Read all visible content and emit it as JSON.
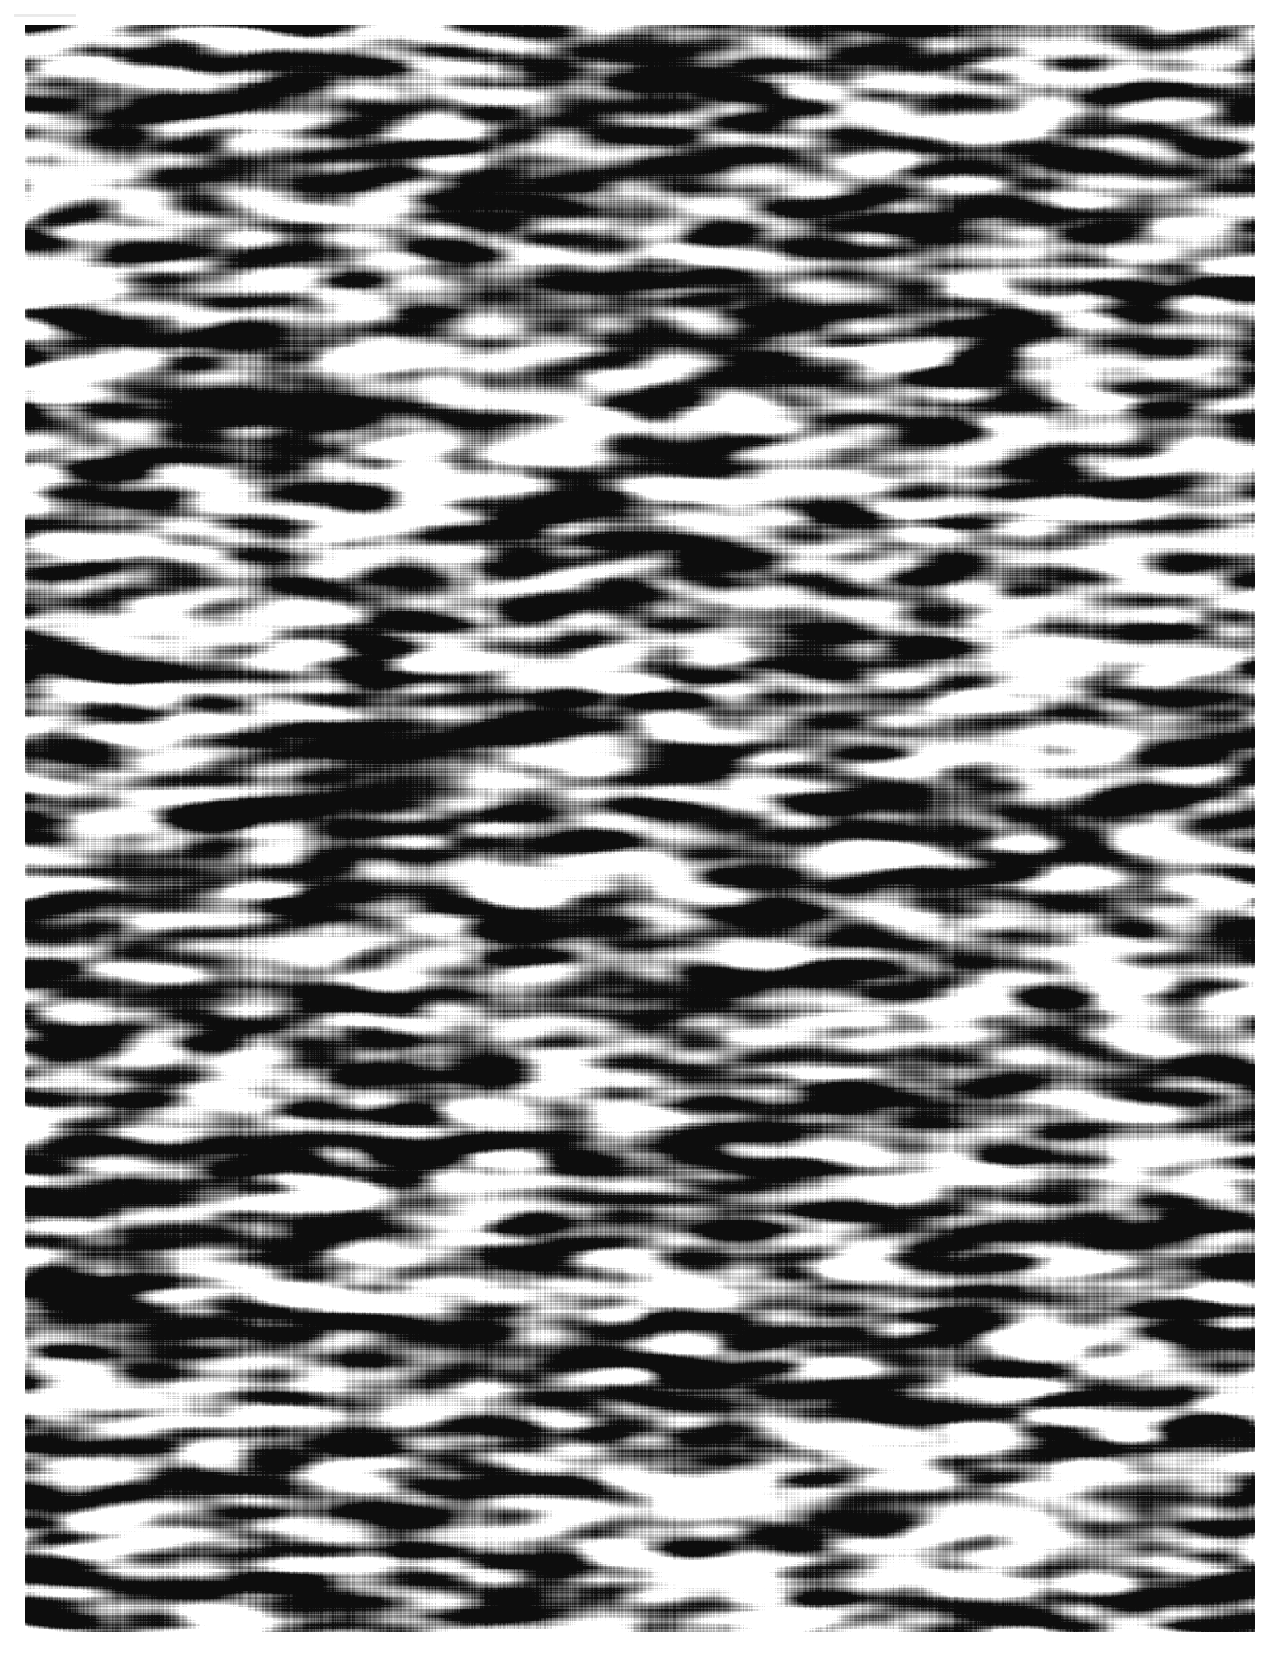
{
  "page": {
    "width": 1280,
    "height": 1676,
    "background_color": "#ffffff",
    "document_type": "scanned-page",
    "visible_text": ""
  },
  "margins": {
    "top": 25,
    "left": 25,
    "right": 25,
    "bottom": 44
  },
  "texture": {
    "name": "anisotropic-binary-noise",
    "x": 25,
    "y": 25,
    "width": 1230,
    "height": 1607,
    "ink_color": "#0d0d0d",
    "paper_color": "#ffffff",
    "coverage_ratio": 0.48,
    "blob_width_px": 28,
    "blob_height_px": 9,
    "horizontal_stretch": 3.1,
    "cell_x": 13,
    "cell_y": 5,
    "smoothing_passes": 2,
    "threshold": 0.5,
    "seed": 20250416,
    "edge_softness": 0.22
  },
  "artifacts": {
    "top_left_streak": {
      "name": "scanner-streak",
      "x": 14,
      "y": 14,
      "width": 62,
      "height": 3,
      "color": "#d9d9d9",
      "opacity": 0.55
    }
  }
}
